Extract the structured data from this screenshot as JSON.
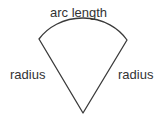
{
  "diagram": {
    "type": "circular-sector",
    "background_color": "#ffffff",
    "stroke_color": "#3a3a3a",
    "stroke_width": 1.3,
    "fill": "none",
    "labels": {
      "arc_length": "arc length",
      "radius_left": "radius",
      "radius_right": "radius"
    },
    "label_color": "#333333",
    "geometry": {
      "apex": [
        83,
        113
      ],
      "arc_start": [
        39,
        39
      ],
      "arc_end": [
        127,
        40
      ],
      "arc_peak": [
        83,
        28
      ],
      "arc_radius_x": 52,
      "arc_radius_y": 46
    }
  }
}
